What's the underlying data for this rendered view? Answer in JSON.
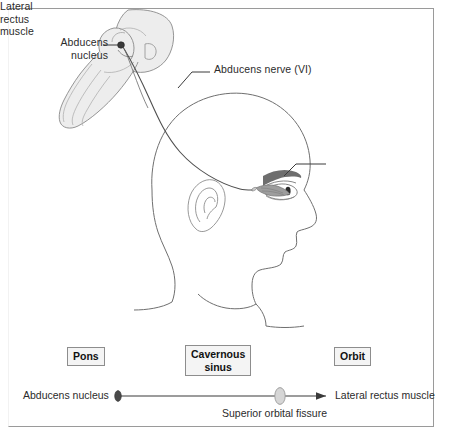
{
  "figure": {
    "background_color": "#ffffff",
    "frame_color": "#9a9a9a",
    "text_color": "#2b2b2b"
  },
  "anatomy_labels": {
    "abducens_nucleus": "Abducens\nnucleus",
    "abducens_nerve": "Abducens nerve (VI)",
    "lateral_rectus_muscle": "Lateral\nrectus\nmuscle"
  },
  "zones": [
    {
      "name": "pons",
      "label": "Pons"
    },
    {
      "name": "cavernous-sinus",
      "label": "Cavernous\nsinus"
    },
    {
      "name": "orbit",
      "label": "Orbit"
    }
  ],
  "pathway_axis": {
    "start_label": "Abducens nucleus",
    "end_label": "Lateral rectus muscle",
    "midpoint_label": "Superior orbital fissure",
    "markers": [
      {
        "name": "abducens-nucleus-marker",
        "color": "#4a4a4a"
      },
      {
        "name": "superior-orbital-fissure-marker",
        "color": "#d6d6d6"
      }
    ],
    "arrow_direction": "left-to-right"
  },
  "illustration": {
    "brainstem_fill": "#ededed",
    "brainstem_stroke": "#8a8a8a",
    "head_stroke": "#6f6f6f",
    "nerve_stroke": "#4f4f4f",
    "nucleus_dot_color": "#3a3a3a",
    "muscle_fill": "#9d9d9d",
    "eyebrow_fill": "#6e6e6e",
    "pupil_fill": "#2a2a2a"
  }
}
